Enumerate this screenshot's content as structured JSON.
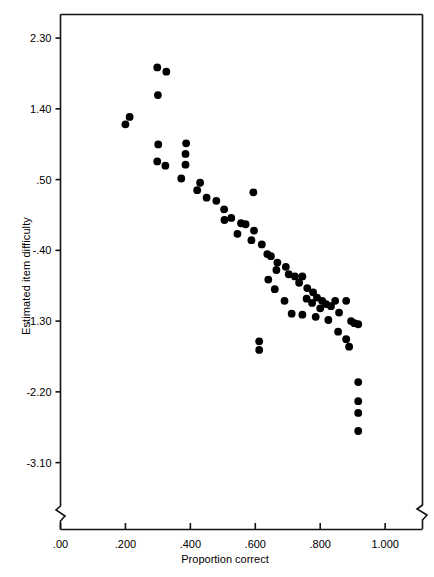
{
  "chart_data": {
    "type": "scatter",
    "title": "",
    "xlabel": "Proportion correct",
    "ylabel": "Estimated item difficulty",
    "xlim": [
      0.0,
      1.115
    ],
    "ylim": [
      -3.55,
      2.6
    ],
    "xticks": [
      0.0,
      0.2,
      0.4,
      0.6,
      0.8,
      1.0
    ],
    "xticklabels": [
      ".00",
      ".200",
      ".400",
      ".600",
      ".800",
      "1.000"
    ],
    "yticks": [
      2.3,
      1.4,
      0.5,
      -0.4,
      -1.3,
      -2.2,
      -3.1
    ],
    "yticklabels": [
      "2.30",
      "1.40",
      ".50",
      "-.40",
      "-1.30",
      "-2.20",
      "-3.10"
    ],
    "grid": false,
    "legend": null,
    "axis_break_x": true,
    "axis_break_y": true,
    "marker": {
      "shape": "circle",
      "color": "#000000",
      "size": 5
    },
    "points": [
      [
        0.213,
        1.297
      ],
      [
        0.2,
        1.203
      ],
      [
        0.298,
        1.927
      ],
      [
        0.326,
        1.873
      ],
      [
        0.3,
        1.575
      ],
      [
        0.301,
        0.948
      ],
      [
        0.387,
        0.962
      ],
      [
        0.298,
        0.731
      ],
      [
        0.323,
        0.677
      ],
      [
        0.385,
        0.826
      ],
      [
        0.385,
        0.69
      ],
      [
        0.372,
        0.514
      ],
      [
        0.421,
        0.365
      ],
      [
        0.48,
        0.23
      ],
      [
        0.504,
        0.122
      ],
      [
        0.594,
        0.338
      ],
      [
        0.526,
        0.013
      ],
      [
        0.556,
        -0.055
      ],
      [
        0.57,
        -0.068
      ],
      [
        0.596,
        -0.149
      ],
      [
        0.588,
        -0.271
      ],
      [
        0.62,
        -0.325
      ],
      [
        0.637,
        -0.447
      ],
      [
        0.648,
        -0.474
      ],
      [
        0.668,
        -0.555
      ],
      [
        0.665,
        -0.65
      ],
      [
        0.694,
        -0.609
      ],
      [
        0.703,
        -0.704
      ],
      [
        0.722,
        -0.731
      ],
      [
        0.735,
        -0.812
      ],
      [
        0.745,
        -0.731
      ],
      [
        0.76,
        -0.88
      ],
      [
        0.758,
        -1.015
      ],
      [
        0.778,
        -0.934
      ],
      [
        0.775,
        -1.069
      ],
      [
        0.79,
        -1.001
      ],
      [
        0.806,
        -1.042
      ],
      [
        0.818,
        -1.083
      ],
      [
        0.833,
        -1.11
      ],
      [
        0.846,
        -1.042
      ],
      [
        0.712,
        -1.205
      ],
      [
        0.745,
        -1.218
      ],
      [
        0.786,
        -1.245
      ],
      [
        0.858,
        -1.191
      ],
      [
        0.88,
        -1.042
      ],
      [
        0.895,
        -1.299
      ],
      [
        0.905,
        -1.326
      ],
      [
        0.917,
        -1.34
      ],
      [
        0.612,
        -1.557
      ],
      [
        0.612,
        -1.666
      ],
      [
        0.88,
        -1.53
      ],
      [
        0.889,
        -1.625
      ],
      [
        0.917,
        -2.075
      ],
      [
        0.917,
        -2.319
      ],
      [
        0.917,
        -2.468
      ],
      [
        0.917,
        -2.698
      ],
      [
        0.855,
        -1.435
      ],
      [
        0.825,
        -1.286
      ],
      [
        0.8,
        -1.137
      ],
      [
        0.69,
        -1.042
      ],
      [
        0.66,
        -0.894
      ],
      [
        0.64,
        -0.772
      ],
      [
        0.545,
        -0.19
      ],
      [
        0.505,
        -0.014
      ],
      [
        0.45,
        0.27
      ],
      [
        0.43,
        0.46
      ]
    ]
  },
  "axes": {
    "frame_color": "#111111",
    "tick_color": "#111111"
  }
}
